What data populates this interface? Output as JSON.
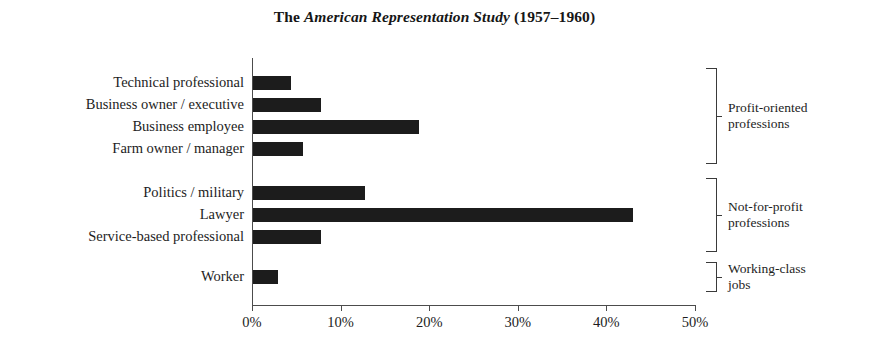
{
  "title": {
    "prefix": "The ",
    "emphasis": "American Representation Study",
    "suffix": " (1957–1960)",
    "full": "The American Representation Study (1957–1960)"
  },
  "chart_data": {
    "type": "bar",
    "orientation": "horizontal",
    "title": "The American Representation Study (1957–1960)",
    "xlabel": "",
    "ylabel": "",
    "xlim": [
      0,
      50
    ],
    "grid": false,
    "legend": "none",
    "bar_color": "#1c1c1c",
    "axis_color": "#4c4c4c",
    "background": "#ffffff",
    "categories": [
      "Technical professional",
      "Business owner / executive",
      "Business employee",
      "Farm owner / manager",
      "Politics / military",
      "Lawyer",
      "Service-based professional",
      "Worker"
    ],
    "values": [
      4.3,
      7.7,
      18.7,
      5.6,
      12.6,
      42.9,
      7.7,
      2.8
    ],
    "xticks": [
      0,
      10,
      20,
      30,
      40,
      50
    ],
    "xtick_labels": [
      "0%",
      "10%",
      "20%",
      "30%",
      "40%",
      "50%"
    ],
    "groups": [
      {
        "label": "Profit-oriented professions",
        "label_line1": "Profit-oriented",
        "label_line2": "professions",
        "members": [
          "Technical professional",
          "Business owner / executive",
          "Business employee",
          "Farm owner / manager"
        ]
      },
      {
        "label": "Not-for-profit professions",
        "label_line1": "Not-for-profit",
        "label_line2": "professions",
        "members": [
          "Politics / military",
          "Lawyer",
          "Service-based professional"
        ]
      },
      {
        "label": "Working-class jobs",
        "label_line1": "Working-class",
        "label_line2": "jobs",
        "members": [
          "Worker"
        ]
      }
    ]
  }
}
